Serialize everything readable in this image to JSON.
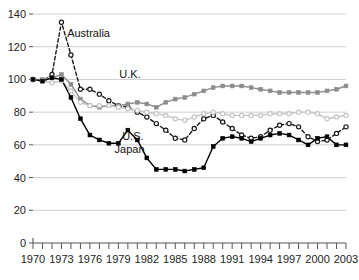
{
  "chart_data": {
    "type": "line",
    "title": "",
    "subtitle": "",
    "xlabel": "",
    "ylabel": "",
    "xlim": [
      1970,
      2003
    ],
    "ylim": [
      0,
      140
    ],
    "yticks": [
      0,
      20,
      40,
      60,
      80,
      100,
      120,
      140
    ],
    "ytick_labels": [
      "0",
      "20",
      "40",
      "60",
      "80",
      "100",
      "120",
      "140"
    ],
    "xticks": [
      1970,
      1971,
      1972,
      1973,
      1974,
      1975,
      1976,
      1977,
      1978,
      1979,
      1980,
      1981,
      1982,
      1983,
      1984,
      1985,
      1986,
      1987,
      1988,
      1989,
      1990,
      1991,
      1992,
      1993,
      1994,
      1995,
      1996,
      1997,
      1998,
      1999,
      2000,
      2001,
      2002,
      2003
    ],
    "xtick_labels_shown": [
      "1970",
      "1973",
      "1976",
      "1979",
      "1982",
      "1985",
      "1988",
      "1991",
      "1994",
      "1997",
      "2000",
      "2003"
    ],
    "xtick_label_years": [
      1970,
      1973,
      1976,
      1979,
      1982,
      1985,
      1988,
      1991,
      1994,
      1997,
      2000,
      2003
    ],
    "grid": "horizontal",
    "legend_position": "inline-annotations",
    "x": [
      1970,
      1971,
      1972,
      1973,
      1974,
      1975,
      1976,
      1977,
      1978,
      1979,
      1980,
      1981,
      1982,
      1983,
      1984,
      1985,
      1986,
      1987,
      1988,
      1989,
      1990,
      1991,
      1992,
      1993,
      1994,
      1995,
      1996,
      1997,
      1998,
      1999,
      2000,
      2001,
      2002,
      2003
    ],
    "series": [
      {
        "name": "Australia",
        "marker": "open-circle",
        "line_style": "dashed",
        "color": "#1a1a1a",
        "label_x": 1973.6,
        "label_y": 126,
        "values": [
          100,
          99,
          103,
          135,
          115,
          94,
          94,
          91,
          87,
          84,
          83,
          80,
          77,
          73,
          69,
          64,
          63,
          70,
          76,
          78,
          74,
          70,
          66,
          64,
          65,
          69,
          72,
          73,
          71,
          65,
          62,
          63,
          67,
          71
        ]
      },
      {
        "name": "U.K.",
        "marker": "filled-square",
        "line_style": "solid",
        "color": "#8c8c8c",
        "label_x": 1979.1,
        "label_y": 101,
        "values": [
          100,
          100,
          101,
          103,
          97,
          88,
          84,
          83,
          84,
          84,
          85,
          86,
          85,
          83,
          86,
          88,
          89,
          91,
          93,
          95,
          96,
          96,
          96,
          95,
          94,
          93,
          92,
          92,
          92,
          92,
          92,
          93,
          94,
          96
        ]
      },
      {
        "name": "U.S.",
        "marker": "open-circle",
        "line_style": "solid",
        "color": "#c4c4c4",
        "label_x": 1979.4,
        "label_y": 63,
        "values": [
          100,
          99,
          98,
          99,
          93,
          86,
          84,
          84,
          84,
          83,
          82,
          81,
          80,
          79,
          78,
          76,
          75,
          77,
          79,
          80,
          79,
          78,
          78,
          78,
          78,
          79,
          79,
          79,
          80,
          80,
          79,
          76,
          77,
          78
        ]
      },
      {
        "name": "Japan",
        "marker": "filled-square",
        "line_style": "solid",
        "color": "#000000",
        "label_x": 1978.6,
        "label_y": 55,
        "values": [
          100,
          99,
          101,
          100,
          89,
          76,
          66,
          63,
          61,
          61,
          69,
          63,
          52,
          45,
          45,
          45,
          44,
          45,
          46,
          59,
          64,
          65,
          64,
          62,
          64,
          66,
          67,
          66,
          63,
          60,
          64,
          65,
          60,
          60
        ]
      }
    ]
  },
  "axis": {
    "y_tick_0": "0",
    "y_tick_20": "20",
    "y_tick_40": "40",
    "y_tick_60": "60",
    "y_tick_80": "80",
    "y_tick_100": "100",
    "y_tick_120": "120",
    "y_tick_140": "140",
    "x_tick_1970": "1970",
    "x_tick_1973": "1973",
    "x_tick_1976": "1976",
    "x_tick_1979": "1979",
    "x_tick_1982": "1982",
    "x_tick_1985": "1985",
    "x_tick_1988": "1988",
    "x_tick_1991": "1991",
    "x_tick_1994": "1994",
    "x_tick_1997": "1997",
    "x_tick_2000": "2000",
    "x_tick_2003": "2003"
  },
  "labels": {
    "australia": "Australia",
    "uk": "U.K.",
    "us": "U.S.",
    "japan": "Japan"
  },
  "colors": {
    "australia": "#1a1a1a",
    "uk": "#8c8c8c",
    "us": "#c4c4c4",
    "japan": "#000000",
    "grid": "#c8c8c8",
    "axis": "#555555",
    "text": "#222222",
    "background": "#ffffff"
  }
}
